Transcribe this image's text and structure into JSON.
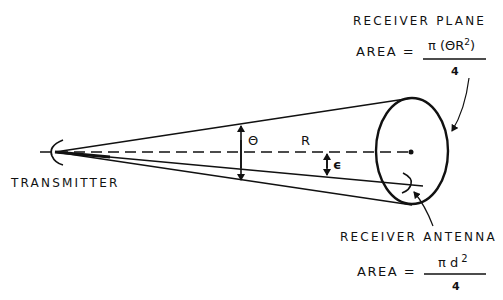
{
  "labels": {
    "transmitter": "TRANSMITTER",
    "receiver_plane": "RECEIVER PLANE",
    "receiver_antenna": "RECEIVER ANTENNA",
    "theta": "Θ",
    "range": "R",
    "epsilon": "ϵ"
  },
  "receiver_plane_area": {
    "lhs": "AREA =",
    "numerator": "π (ΘR",
    "numerator_exp": "2",
    "numerator_close": ")",
    "denominator": "4"
  },
  "receiver_antenna_area": {
    "lhs": "AREA =",
    "numerator": "π d",
    "numerator_exp": "2",
    "denominator": "4"
  },
  "colors": {
    "ink": "#111111",
    "background": "#ffffff"
  }
}
